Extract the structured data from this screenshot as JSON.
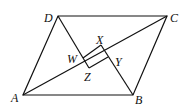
{
  "figure": {
    "type": "geometry",
    "points": {
      "A": {
        "label": "A",
        "x": 23,
        "y": 95
      },
      "B": {
        "label": "B",
        "x": 133,
        "y": 95
      },
      "C": {
        "label": "C",
        "x": 167,
        "y": 16
      },
      "D": {
        "label": "D",
        "x": 58,
        "y": 16
      },
      "W": {
        "label": "W",
        "x": 83,
        "y": 58
      },
      "X": {
        "label": "X",
        "x": 101,
        "y": 45
      },
      "Y": {
        "label": "Y",
        "x": 108,
        "y": 57
      },
      "Z": {
        "label": "Z",
        "x": 89,
        "y": 68
      }
    },
    "stroke_color": "#111111"
  }
}
